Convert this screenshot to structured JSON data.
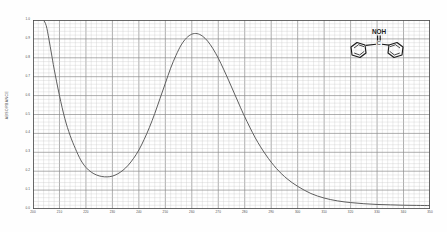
{
  "figure": {
    "ylabel": "ABSORBANCE",
    "inset_label_noh": "NOH",
    "inset_label_c": "C"
  },
  "colors": {
    "curve": "#555555",
    "grid_minor": "#c9c9c9",
    "grid_major": "#8c8c8c",
    "frame": "#4d4d4d",
    "text": "#4a4a4a",
    "structure": "#1b1b1b",
    "background": "#ffffff"
  },
  "chart_data": {
    "type": "line",
    "title": "",
    "subtitle": "",
    "xlabel": "",
    "ylabel": "ABSORBANCE",
    "xlim": [
      200,
      350
    ],
    "ylim": [
      0.0,
      1.0
    ],
    "grid": true,
    "legend": false,
    "xticks": [
      200,
      210,
      220,
      230,
      240,
      250,
      260,
      270,
      280,
      290,
      300,
      310,
      320,
      330,
      340,
      350
    ],
    "xticklabels": [
      "200",
      "210",
      "220",
      "230",
      "240",
      "250",
      "260",
      "270",
      "280",
      "290",
      "300",
      "310",
      "320",
      "330",
      "340",
      "350"
    ],
    "yticks": [
      0.0,
      0.1,
      0.2,
      0.3,
      0.4,
      0.5,
      0.6,
      0.7,
      0.8,
      0.9,
      1.0
    ],
    "yticklabels": [
      "0.0",
      "0.1",
      "0.2",
      "0.3",
      "0.4",
      "0.5",
      "0.6",
      "0.7",
      "0.8",
      "0.9",
      "1.0"
    ],
    "annotations": [
      "NOH",
      "C"
    ],
    "series": [
      {
        "name": "Benzophenone oxime absorbance",
        "x": [
          204,
          205,
          206,
          207,
          208,
          210,
          212,
          214,
          216,
          218,
          220,
          222,
          224,
          226,
          228,
          230,
          232,
          234,
          236,
          238,
          240,
          242,
          244,
          246,
          248,
          250,
          252,
          254,
          256,
          258,
          260,
          262,
          264,
          266,
          268,
          270,
          272,
          274,
          276,
          278,
          280,
          284,
          288,
          292,
          296,
          300,
          305,
          310,
          315,
          320,
          325,
          330,
          335,
          340,
          345,
          350
        ],
        "y": [
          1.0,
          0.97,
          0.9,
          0.82,
          0.74,
          0.6,
          0.48,
          0.39,
          0.32,
          0.26,
          0.22,
          0.195,
          0.18,
          0.172,
          0.17,
          0.174,
          0.186,
          0.205,
          0.232,
          0.268,
          0.312,
          0.368,
          0.432,
          0.505,
          0.585,
          0.665,
          0.745,
          0.812,
          0.868,
          0.905,
          0.925,
          0.928,
          0.915,
          0.888,
          0.848,
          0.798,
          0.74,
          0.678,
          0.614,
          0.55,
          0.488,
          0.376,
          0.286,
          0.214,
          0.16,
          0.12,
          0.082,
          0.058,
          0.043,
          0.034,
          0.028,
          0.024,
          0.022,
          0.02,
          0.019,
          0.018
        ]
      }
    ]
  }
}
